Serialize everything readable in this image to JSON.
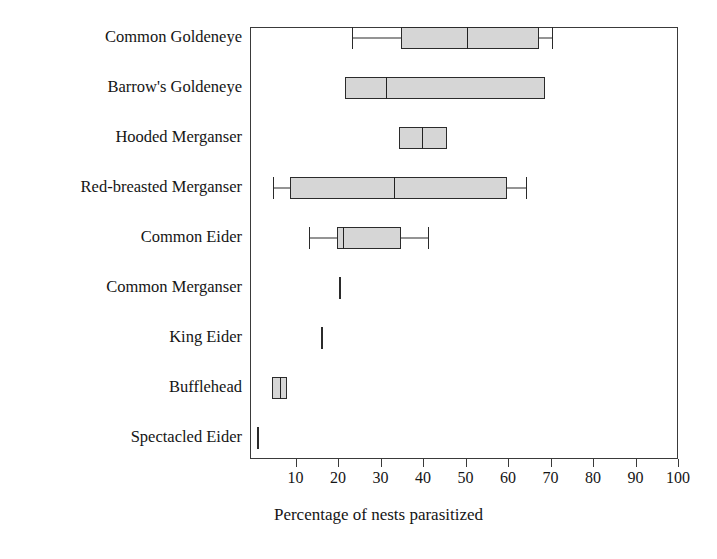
{
  "chart_data": {
    "type": "boxplot",
    "title": "",
    "xlabel": "Percentage of nests parasitized",
    "ylabel": "",
    "xlim": [
      0,
      100
    ],
    "xticks": [
      10,
      20,
      30,
      40,
      50,
      60,
      70,
      80,
      90,
      100
    ],
    "xticklabels": [
      "10",
      "20",
      "30",
      "40",
      "50",
      "60",
      "70",
      "80",
      "90",
      "100"
    ],
    "grid": false,
    "legend": "none",
    "orientation": "horizontal",
    "box_fill_color": "#d6d6d6",
    "line_color": "#2b2b2b",
    "categories": [
      "Common Goldeneye",
      "Barrow's Goldeneye",
      "Hooded Merganser",
      "Red-breasted Merganser",
      "Common Eider",
      "Common Merganser",
      "King Eider",
      "Bufflehead",
      "Spectacled Eider"
    ],
    "boxes": [
      {
        "category": "Common Goldeneye",
        "whisker_low": 23,
        "q1": 34.5,
        "median": 50,
        "q3": 67,
        "whisker_high": 70,
        "has_whiskers": true,
        "single_line": false
      },
      {
        "category": "Barrow's Goldeneye",
        "whisker_low": 21.5,
        "q1": 21.5,
        "median": 31,
        "q3": 68.5,
        "whisker_high": 68.5,
        "has_whiskers": false,
        "single_line": false
      },
      {
        "category": "Hooded Merganser",
        "whisker_low": 34,
        "q1": 34,
        "median": 39.5,
        "q3": 45.5,
        "whisker_high": 45.5,
        "has_whiskers": false,
        "single_line": false
      },
      {
        "category": "Red-breasted Merganser",
        "whisker_low": 4.5,
        "q1": 8.5,
        "median": 33,
        "q3": 59.5,
        "whisker_high": 64,
        "has_whiskers": true,
        "single_line": false
      },
      {
        "category": "Common Eider",
        "whisker_low": 13,
        "q1": 19.5,
        "median": 21,
        "q3": 34.5,
        "whisker_high": 41,
        "has_whiskers": true,
        "single_line": false
      },
      {
        "category": "Common Merganser",
        "whisker_low": 20,
        "q1": 20,
        "median": 20,
        "q3": 20,
        "whisker_high": 20,
        "has_whiskers": false,
        "single_line": true
      },
      {
        "category": "King Eider",
        "whisker_low": 15.8,
        "q1": 15.8,
        "median": 15.8,
        "q3": 15.8,
        "whisker_high": 15.8,
        "has_whiskers": false,
        "single_line": true
      },
      {
        "category": "Bufflehead",
        "whisker_low": 4.2,
        "q1": 4.2,
        "median": 6,
        "q3": 7.8,
        "whisker_high": 7.8,
        "has_whiskers": false,
        "single_line": false
      },
      {
        "category": "Spectacled Eider",
        "whisker_low": 0.6,
        "q1": 0.6,
        "median": 0.6,
        "q3": 0.6,
        "whisker_high": 0.6,
        "has_whiskers": false,
        "single_line": true
      }
    ]
  }
}
